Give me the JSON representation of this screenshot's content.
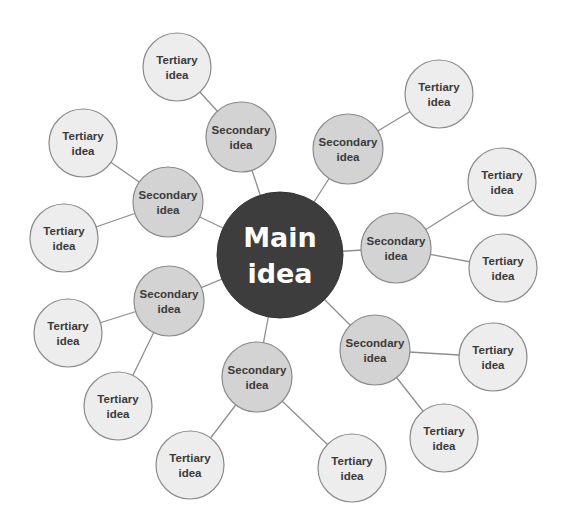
{
  "colors": {
    "main_fill": "#3d3d3d",
    "secondary_fill": "#d3d3d3",
    "tertiary_fill": "#ededed",
    "stroke": "#8a8a8a",
    "edge": "#8e8e8e"
  },
  "main": {
    "id": "main",
    "x": 280,
    "y": 255,
    "r": 63,
    "lines": [
      "Main",
      "idea"
    ]
  },
  "secondary": [
    {
      "id": "s1",
      "x": 241,
      "y": 137,
      "r": 35,
      "lines": [
        "Secondary",
        "idea"
      ]
    },
    {
      "id": "s2",
      "x": 348,
      "y": 149,
      "r": 35,
      "lines": [
        "Secondary",
        "idea"
      ]
    },
    {
      "id": "s3",
      "x": 168,
      "y": 202,
      "r": 35,
      "lines": [
        "Secondary",
        "idea"
      ]
    },
    {
      "id": "s4",
      "x": 396,
      "y": 248,
      "r": 35,
      "lines": [
        "Secondary",
        "idea"
      ]
    },
    {
      "id": "s5",
      "x": 169,
      "y": 301,
      "r": 35,
      "lines": [
        "Secondary",
        "idea"
      ]
    },
    {
      "id": "s6",
      "x": 375,
      "y": 350,
      "r": 35,
      "lines": [
        "Secondary",
        "idea"
      ]
    },
    {
      "id": "s7",
      "x": 257,
      "y": 377,
      "r": 35,
      "lines": [
        "Secondary",
        "idea"
      ]
    }
  ],
  "tertiary": [
    {
      "id": "t1",
      "parent": "s1",
      "x": 177,
      "y": 67,
      "r": 34,
      "lines": [
        "Tertiary",
        "idea"
      ]
    },
    {
      "id": "t2",
      "parent": "s2",
      "x": 439,
      "y": 94,
      "r": 34,
      "lines": [
        "Tertiary",
        "idea"
      ]
    },
    {
      "id": "t3",
      "parent": "s3",
      "x": 83,
      "y": 143,
      "r": 34,
      "lines": [
        "Tertiary",
        "idea"
      ]
    },
    {
      "id": "t4",
      "parent": "s3",
      "x": 64,
      "y": 238,
      "r": 34,
      "lines": [
        "Tertiary",
        "idea"
      ]
    },
    {
      "id": "t5",
      "parent": "s4",
      "x": 502,
      "y": 182,
      "r": 34,
      "lines": [
        "Tertiary",
        "idea"
      ]
    },
    {
      "id": "t6",
      "parent": "s4",
      "x": 503,
      "y": 268,
      "r": 34,
      "lines": [
        "Tertiary",
        "idea"
      ]
    },
    {
      "id": "t7",
      "parent": "s5",
      "x": 68,
      "y": 333,
      "r": 34,
      "lines": [
        "Tertiary",
        "idea"
      ]
    },
    {
      "id": "t8",
      "parent": "s5",
      "x": 118,
      "y": 406,
      "r": 34,
      "lines": [
        "Tertiary",
        "idea"
      ]
    },
    {
      "id": "t9",
      "parent": "s6",
      "x": 493,
      "y": 357,
      "r": 34,
      "lines": [
        "Tertiary",
        "idea"
      ]
    },
    {
      "id": "t10",
      "parent": "s6",
      "x": 444,
      "y": 438,
      "r": 34,
      "lines": [
        "Tertiary",
        "idea"
      ]
    },
    {
      "id": "t11",
      "parent": "s7",
      "x": 190,
      "y": 465,
      "r": 34,
      "lines": [
        "Tertiary",
        "idea"
      ]
    },
    {
      "id": "t12",
      "parent": "s7",
      "x": 352,
      "y": 468,
      "r": 34,
      "lines": [
        "Tertiary",
        "idea"
      ]
    }
  ]
}
